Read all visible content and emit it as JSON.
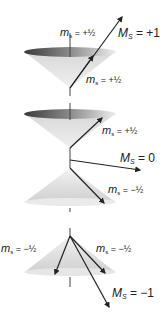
{
  "diagram": {
    "type": "vector-model-spin-cones",
    "panels": [
      {
        "id": "triplet-plus-one",
        "labels": {
          "upper_spin": {
            "symbol": "m",
            "subscript": "s",
            "value": "= +½"
          },
          "lower_spin": {
            "symbol": "m",
            "subscript": "s",
            "value": "= +½"
          },
          "total": {
            "symbol": "M",
            "subscript": "S",
            "value": "= +1"
          }
        }
      },
      {
        "id": "triplet-zero",
        "labels": {
          "upper_spin": {
            "symbol": "m",
            "subscript": "s",
            "value": "= +½"
          },
          "total": {
            "symbol": "M",
            "subscript": "S",
            "value": "= 0"
          },
          "lower_spin": {
            "symbol": "m",
            "subscript": "s",
            "value": "= −½"
          }
        }
      },
      {
        "id": "triplet-minus-one",
        "labels": {
          "left_spin": {
            "symbol": "m",
            "subscript": "s",
            "value": "= −½"
          },
          "right_spin": {
            "symbol": "m",
            "subscript": "s",
            "value": "= −½"
          },
          "total": {
            "symbol": "M",
            "subscript": "S",
            "value": "= −1"
          }
        }
      }
    ],
    "colors": {
      "cone_fill": "#e2e2e2",
      "cone_rim_dark": "#555555",
      "arrow": "#222222",
      "axis": "#444444"
    }
  }
}
